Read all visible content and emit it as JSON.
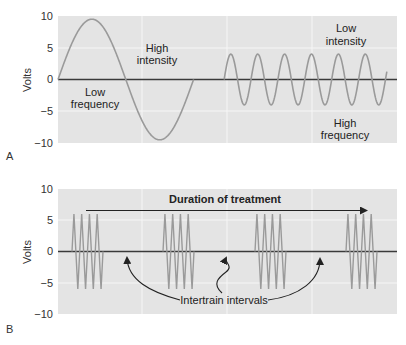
{
  "chart_data": [
    {
      "panel": "A",
      "type": "line",
      "ylabel": "Volts",
      "xlabel": "",
      "ylim": [
        -10,
        10
      ],
      "yticks": [
        10,
        5,
        0,
        -5,
        -10
      ],
      "grid": true,
      "series": [
        {
          "name": "Low frequency, high intensity",
          "waveform": "sine",
          "amplitude": 9.5,
          "cycles": 1,
          "x_range_fraction": [
            0.0,
            0.4
          ]
        },
        {
          "name": "High frequency, low intensity",
          "waveform": "sine",
          "amplitude": 4,
          "cycles": 6,
          "x_range_fraction": [
            0.49,
            0.97
          ]
        }
      ],
      "annotations": [
        {
          "text": "High intensity",
          "lines": [
            "High",
            "intensity"
          ]
        },
        {
          "text": "Low frequency",
          "lines": [
            "Low",
            "frequency"
          ]
        },
        {
          "text": "Low intensity",
          "lines": [
            "Low",
            "intensity"
          ]
        },
        {
          "text": "High frequency",
          "lines": [
            "High",
            "frequency"
          ]
        }
      ]
    },
    {
      "panel": "B",
      "type": "line",
      "ylabel": "Volts",
      "xlabel": "",
      "ylim": [
        -10,
        10
      ],
      "yticks": [
        10,
        5,
        0,
        -5,
        -10
      ],
      "grid": true,
      "series": [
        {
          "name": "Pulse trains",
          "waveform": "triangle bursts",
          "amplitude": 6,
          "cycles_per_burst": 4,
          "burst_count": 4
        }
      ],
      "annotations": [
        {
          "text": "Duration of treatment",
          "type": "arrow-right"
        },
        {
          "text": "Intertrain intervals",
          "type": "arrows-to-gaps",
          "count": 3
        }
      ]
    }
  ],
  "panels": {
    "a": {
      "letter": "A",
      "ylabel": "Volts",
      "ticks": [
        "10",
        "5",
        "0",
        "−5",
        "−10"
      ],
      "labels": {
        "high": "High",
        "intensity": "intensity",
        "low": "Low",
        "frequency": "frequency",
        "low2": "Low",
        "intensity2": "intensity",
        "high2": "High",
        "frequency2": "frequency"
      }
    },
    "b": {
      "letter": "B",
      "ylabel": "Volts",
      "ticks": [
        "10",
        "5",
        "0",
        "−5",
        "−10"
      ],
      "duration_label": "Duration of treatment",
      "intertrain_label": "Intertrain intervals"
    }
  },
  "colors": {
    "plot_bg": "#e4e4e4",
    "grid": "#f6f6f6",
    "wave": "#9a9a9a",
    "axis": "#3a3a3a",
    "arrow": "#222222"
  }
}
